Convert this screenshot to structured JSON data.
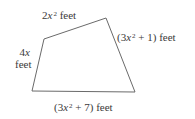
{
  "figure": {
    "type": "quadrilateral",
    "vertices": [
      [
        44,
        39
      ],
      [
        106,
        18
      ],
      [
        135,
        92
      ],
      [
        32,
        91
      ]
    ],
    "stroke_color": "#6a6a6a",
    "sides": {
      "top": {
        "coef": "2",
        "var": "x",
        "exp": "2",
        "const": "",
        "unit": "feet",
        "text": "2x^2 feet"
      },
      "right": {
        "open": "(3",
        "var": "x",
        "exp": "2",
        "rest": " + 1) feet",
        "text": "(3x^2 + 1) feet"
      },
      "left": {
        "line1": "4x",
        "coef": "4",
        "var": "x",
        "line2": "feet",
        "text": "4x feet"
      },
      "bottom": {
        "open": "(3",
        "var": "x",
        "exp": "2",
        "rest": " + 7) feet",
        "text": "(3x^2 + 7) feet"
      }
    }
  }
}
